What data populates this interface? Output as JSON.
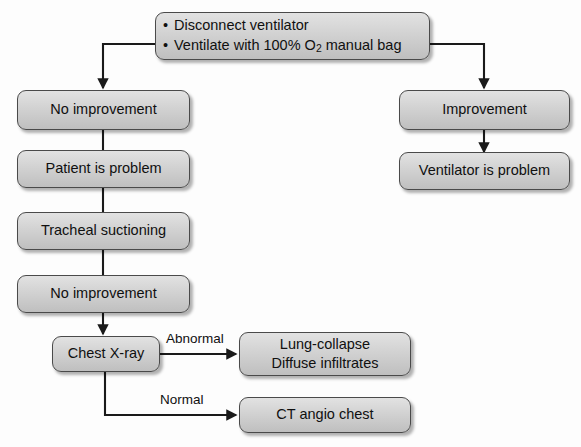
{
  "diagram": {
    "style": {
      "node_fill_top": "#e2e2e2",
      "node_fill_bottom": "#bfbfbf",
      "node_border": "#4a4a4a",
      "line_color": "#1a1a1a",
      "text_color": "#101010",
      "background": "#fdfdfd"
    },
    "nodes": [
      {
        "id": "start",
        "name": "disconnect-ventilate-node",
        "type": "bulleted",
        "bullets": [
          "Disconnect ventilator",
          "Ventilate with 100% O₂ manual bag"
        ],
        "bullet_parts": [
          {
            "pre": "Ventilate with 100% O",
            "sub": "2",
            "post": " manual bag"
          }
        ]
      },
      {
        "id": "no_improvement_1",
        "name": "no-improvement-node-1",
        "label": "No improvement"
      },
      {
        "id": "patient_problem",
        "name": "patient-is-problem-node",
        "label": "Patient is problem"
      },
      {
        "id": "tracheal_suctioning",
        "name": "tracheal-suctioning-node",
        "label": "Tracheal suctioning"
      },
      {
        "id": "no_improvement_2",
        "name": "no-improvement-node-2",
        "label": "No improvement"
      },
      {
        "id": "chest_xray",
        "name": "chest-xray-node",
        "label": "Chest X-ray"
      },
      {
        "id": "lung_collapse",
        "name": "lung-collapse-diffuse-infiltrates-node",
        "lines": [
          "Lung-collapse",
          "Diffuse infiltrates"
        ]
      },
      {
        "id": "ct_angio",
        "name": "ct-angio-chest-node",
        "label": "CT angio chest"
      },
      {
        "id": "improvement",
        "name": "improvement-node",
        "label": "Improvement"
      },
      {
        "id": "ventilator_problem",
        "name": "ventilator-is-problem-node",
        "label": "Ventilator is problem"
      }
    ],
    "edge_labels": {
      "abnormal": "Abnormal",
      "normal": "Normal"
    }
  }
}
